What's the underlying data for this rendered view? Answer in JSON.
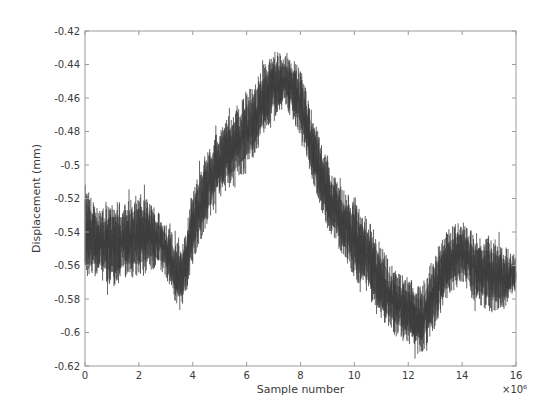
{
  "chart_data": {
    "type": "line",
    "title": "",
    "xlabel": "Sample number",
    "ylabel": "Displacement (mm)",
    "x_multiplier_label": "×10^6",
    "xlim": [
      0,
      16
    ],
    "ylim": [
      -0.62,
      -0.42
    ],
    "grid": false,
    "legend": null,
    "x_ticks": [
      0,
      2,
      4,
      6,
      8,
      10,
      12,
      14,
      16
    ],
    "x_tick_labels": [
      "0",
      "2",
      "4",
      "6",
      "8",
      "10",
      "12",
      "14",
      "16"
    ],
    "y_ticks": [
      -0.42,
      -0.44,
      -0.46,
      -0.48,
      -0.5,
      -0.52,
      -0.54,
      -0.56,
      -0.58,
      -0.6,
      -0.62
    ],
    "y_tick_labels": [
      "-0.42",
      "-0.44",
      "-0.46",
      "-0.48",
      "-0.5",
      "-0.52",
      "-0.54",
      "-0.56",
      "-0.58",
      "-0.6",
      "-0.62"
    ],
    "line_color": "#3c3c3c",
    "series": [
      {
        "name": "Displacement",
        "description": "Dense noisy signal; envelope (upper/lower) and mean estimated from plot",
        "x": [
          0,
          0.5,
          1,
          1.5,
          2,
          2.5,
          3,
          3.5,
          3.7,
          4,
          4.5,
          5,
          5.5,
          6,
          6.5,
          7,
          7.5,
          8,
          8.5,
          9,
          9.5,
          10,
          10.5,
          11,
          11.5,
          12,
          12.5,
          13,
          13.5,
          14,
          14.5,
          15,
          15.5,
          16
        ],
        "upper": [
          -0.515,
          -0.53,
          -0.525,
          -0.525,
          -0.52,
          -0.525,
          -0.535,
          -0.55,
          -0.545,
          -0.515,
          -0.495,
          -0.48,
          -0.47,
          -0.46,
          -0.445,
          -0.435,
          -0.435,
          -0.445,
          -0.475,
          -0.5,
          -0.515,
          -0.525,
          -0.535,
          -0.55,
          -0.565,
          -0.57,
          -0.575,
          -0.555,
          -0.54,
          -0.535,
          -0.545,
          -0.545,
          -0.55,
          -0.555
        ],
        "lower": [
          -0.565,
          -0.565,
          -0.57,
          -0.565,
          -0.565,
          -0.56,
          -0.565,
          -0.585,
          -0.58,
          -0.555,
          -0.535,
          -0.515,
          -0.51,
          -0.5,
          -0.485,
          -0.47,
          -0.465,
          -0.48,
          -0.51,
          -0.535,
          -0.55,
          -0.565,
          -0.575,
          -0.59,
          -0.6,
          -0.605,
          -0.61,
          -0.595,
          -0.575,
          -0.57,
          -0.58,
          -0.585,
          -0.585,
          -0.575
        ],
        "mean": [
          -0.54,
          -0.547,
          -0.547,
          -0.545,
          -0.543,
          -0.542,
          -0.55,
          -0.567,
          -0.562,
          -0.535,
          -0.515,
          -0.497,
          -0.49,
          -0.48,
          -0.465,
          -0.452,
          -0.45,
          -0.462,
          -0.492,
          -0.517,
          -0.532,
          -0.545,
          -0.555,
          -0.57,
          -0.582,
          -0.587,
          -0.592,
          -0.575,
          -0.557,
          -0.552,
          -0.562,
          -0.565,
          -0.567,
          -0.565
        ]
      }
    ]
  },
  "plot_area": {
    "left": 85,
    "top": 31,
    "right": 516,
    "bottom": 366
  }
}
